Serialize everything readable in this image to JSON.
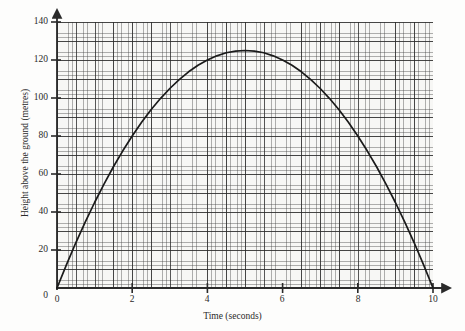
{
  "chart_data": {
    "type": "line",
    "title": "",
    "subtitle": "",
    "xlabel": "Time (seconds)",
    "ylabel": "Height above the ground (metres)",
    "xlim": [
      0,
      10
    ],
    "ylim": [
      0,
      140
    ],
    "xticks": [
      0,
      2,
      4,
      6,
      8,
      10
    ],
    "yticks": [
      0,
      20,
      40,
      60,
      80,
      100,
      120,
      140
    ],
    "xtick_labels": [
      "0",
      "2",
      "4",
      "6",
      "8",
      "10"
    ],
    "ytick_labels": [
      "0",
      "20",
      "40",
      "60",
      "80",
      "100",
      "120",
      "140"
    ],
    "grid": true,
    "grid_style": "graph-paper, minor every 0.1 s / 1 m, major every 0.5 s / 5 m",
    "legend": "none",
    "axis_arrows": true,
    "series": [
      {
        "name": "Height of projectile",
        "color": "#1a1a1a",
        "x": [
          0,
          0.25,
          0.5,
          0.75,
          1,
          1.25,
          1.5,
          1.75,
          2,
          2.25,
          2.5,
          2.75,
          3,
          3.25,
          3.5,
          3.75,
          4,
          4.25,
          4.5,
          4.75,
          5,
          5.25,
          5.5,
          5.75,
          6,
          6.25,
          6.5,
          6.75,
          7,
          7.25,
          7.5,
          7.75,
          8,
          8.25,
          8.5,
          8.75,
          9,
          9.25,
          9.5,
          9.75,
          10
        ],
        "y": [
          0,
          12.2,
          23.8,
          34.7,
          45,
          54.7,
          63.8,
          72.2,
          80,
          87.2,
          93.8,
          99.7,
          105,
          109.7,
          113.8,
          117.2,
          120,
          122.2,
          123.8,
          124.7,
          125,
          124.7,
          123.8,
          122.2,
          120,
          117.2,
          113.8,
          109.7,
          105,
          99.7,
          93.8,
          87.2,
          80,
          72.2,
          63.8,
          54.7,
          45,
          34.7,
          23.8,
          12.2,
          0
        ]
      }
    ],
    "annotations": {
      "peak_value": 125,
      "peak_time": 5,
      "launch_time": 0,
      "landing_time": 10
    }
  },
  "axes": {
    "x_title": "Time (seconds)",
    "y_title": "Height above the ground (metres)"
  }
}
